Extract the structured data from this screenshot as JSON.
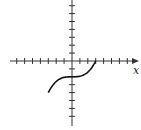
{
  "figure": {
    "type": "function-graph",
    "x_axis_label": "x",
    "y_axis_label": "",
    "tick_spacing_units": 1,
    "x_ticks": [
      -7,
      -6,
      -5,
      -4,
      -3,
      -2,
      -1,
      1,
      2,
      3,
      4,
      5,
      6,
      7
    ],
    "y_ticks": [
      -7,
      -6,
      -5,
      -4,
      -3,
      -2,
      -1,
      1,
      2,
      3,
      4,
      5,
      6,
      7
    ],
    "curve": {
      "description": "cubic curve y = (x^3)/13.5 - 2, drawn for x in [-3, 3]",
      "x_range": [
        -3,
        3
      ],
      "points": [
        [
          -3,
          -4
        ],
        [
          -2,
          -2.59
        ],
        [
          -1,
          -2.07
        ],
        [
          0,
          -2
        ],
        [
          1,
          -1.93
        ],
        [
          2,
          -1.41
        ],
        [
          3,
          0
        ]
      ]
    },
    "colors": {
      "axes": "#333333",
      "curve": "#111111",
      "background": "#ffffff"
    }
  }
}
